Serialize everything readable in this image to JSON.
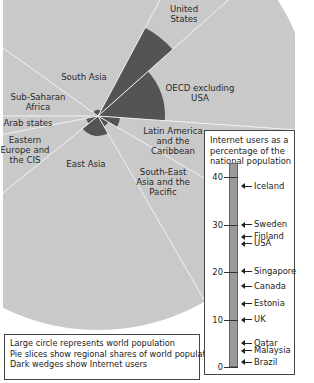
{
  "diagram": {
    "type": "pie-with-radial-wedges",
    "colors": {
      "population_slice": "#c9c9c9",
      "internet_wedge": "#545454",
      "divider": "#f2f2f2"
    },
    "center": [
      98,
      116
    ],
    "radius": 214,
    "regions": [
      {
        "name": "United States",
        "label": "United\nStates",
        "start_deg": -61.9,
        "end_deg": -41.7,
        "wedge_radius": 100
      },
      {
        "name": "OECD excluding USA",
        "label": "OECD excluding\nUSA",
        "start_deg": -41.7,
        "end_deg": 4,
        "wedge_radius": 67
      },
      {
        "name": "Latin America and the Caribbean",
        "label": "Latin America\nand the\nCaribbean",
        "start_deg": 4,
        "end_deg": 30.3,
        "wedge_radius": 22
      },
      {
        "name": "South-East Asia and the Pacific",
        "label": "South-East\nAsia and the\nPacific",
        "start_deg": 30.3,
        "end_deg": 60,
        "wedge_radius": 12
      },
      {
        "name": "East Asia",
        "label": "East Asia",
        "start_deg": 60,
        "end_deg": 141,
        "wedge_radius": 20
      },
      {
        "name": "Eastern Europe and the CIS",
        "label": "Eastern\nEurope and\nthe CIS",
        "start_deg": 141,
        "end_deg": 169,
        "wedge_radius": 12
      },
      {
        "name": "Arab states",
        "label": "Arab states",
        "start_deg": 169,
        "end_deg": 180,
        "wedge_radius": 7
      },
      {
        "name": "Sub-Saharan Africa",
        "label": "Sub-Saharan\nAfrica",
        "start_deg": 180,
        "end_deg": 215.6,
        "wedge_radius": 3
      },
      {
        "name": "South Asia",
        "label": "South Asia",
        "start_deg": 215.6,
        "end_deg": 298.1,
        "wedge_radius": 6
      }
    ]
  },
  "labels": {
    "united_states": [
      "United",
      "States"
    ],
    "oecd": [
      "OECD excluding",
      "USA"
    ],
    "south_asia": [
      "South Asia"
    ],
    "sub_saharan": [
      "Sub-Saharan",
      "Africa"
    ],
    "arab": [
      "Arab states"
    ],
    "eastern_europe": [
      "Eastern",
      "Europe and",
      "the CIS"
    ],
    "east_asia": [
      "East Asia"
    ],
    "latin_america": [
      "Latin America",
      "and the",
      "Caribbean"
    ],
    "se_asia": [
      "South-East",
      "Asia and the",
      "Pacific"
    ]
  },
  "legend": {
    "lines": [
      "Large circle represents world population",
      "Pie slices show regional shares of world population",
      "Dark wedges show Internet users"
    ]
  },
  "scale": {
    "title_lines": [
      "Internet users as a",
      "percentage of the",
      "national population"
    ],
    "ticks": [
      {
        "value": 40,
        "label": "40"
      },
      {
        "value": 30,
        "label": "30"
      },
      {
        "value": 20,
        "label": "20"
      },
      {
        "value": 10,
        "label": "10"
      },
      {
        "value": 0,
        "label": "0"
      }
    ],
    "bar_max": 43,
    "countries": [
      {
        "name": "Iceland",
        "value": 38.1
      },
      {
        "name": "Sweden",
        "value": 30
      },
      {
        "name": "Finland",
        "value": 27.4
      },
      {
        "name": "USA",
        "value": 25.9
      },
      {
        "name": "Singapore",
        "value": 20.2
      },
      {
        "name": "Canada",
        "value": 17
      },
      {
        "name": "Estonia",
        "value": 13.3
      },
      {
        "name": "UK",
        "value": 10
      },
      {
        "name": "Qatar",
        "value": 5
      },
      {
        "name": "Malaysia",
        "value": 3.4
      },
      {
        "name": "Brazil",
        "value": 1
      }
    ]
  }
}
